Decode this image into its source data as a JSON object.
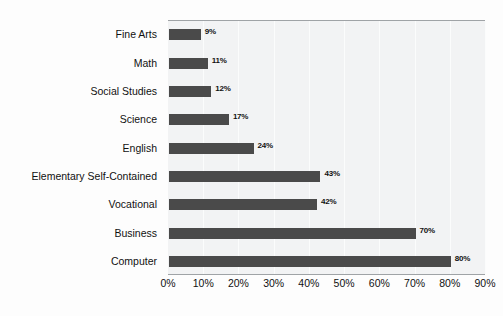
{
  "chart_data": {
    "type": "bar",
    "orientation": "horizontal",
    "title": "",
    "xlabel": "",
    "ylabel": "",
    "xlim": [
      0,
      90
    ],
    "grid": true,
    "legend": false,
    "tick_labels": [
      "0%",
      "10%",
      "20%",
      "30%",
      "40%",
      "50%",
      "60%",
      "70%",
      "80%",
      "90%"
    ],
    "tick_values": [
      0,
      10,
      20,
      30,
      40,
      50,
      60,
      70,
      80,
      90
    ],
    "categories": [
      "Fine Arts",
      "Math",
      "Social Studies",
      "Science",
      "English",
      "Elementary Self-Contained",
      "Vocational",
      "Business",
      "Computer"
    ],
    "values": [
      9,
      11,
      12,
      17,
      24,
      43,
      42,
      70,
      80
    ],
    "value_labels": [
      "9%",
      "11%",
      "12%",
      "17%",
      "24%",
      "43%",
      "42%",
      "70%",
      "80%"
    ],
    "bar_color": "#4a4a4a",
    "plot_background": "#f2f3f4",
    "page_background": "#fdfdfd",
    "axis_line_color": "#9fa3a6"
  }
}
